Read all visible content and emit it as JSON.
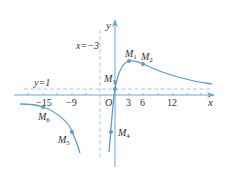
{
  "figure": {
    "axes": {
      "x_label": "x",
      "y_label": "y",
      "origin_label": "O",
      "x_ticks": [
        {
          "label": "−15",
          "value": -15
        },
        {
          "label": "−9",
          "value": -9
        },
        {
          "label": "3",
          "value": 3
        },
        {
          "label": "6",
          "value": 6
        },
        {
          "label": "12",
          "value": 12
        }
      ]
    },
    "asymptotes": {
      "vertical": {
        "label": "x=−3",
        "value": -3
      },
      "horizontal": {
        "label": "y=1",
        "value": 1
      }
    },
    "points": [
      {
        "name": "M",
        "sub": "1"
      },
      {
        "name": "M",
        "sub": "2"
      },
      {
        "name": "M",
        "sub": "3"
      },
      {
        "name": "M",
        "sub": "4"
      },
      {
        "name": "M",
        "sub": "5"
      },
      {
        "name": "M",
        "sub": "6"
      }
    ],
    "colors": {
      "curve": "#5b9bd5",
      "axis": "#6aa6dc",
      "dashed": "#9cc3e8",
      "text": "#333333"
    }
  }
}
